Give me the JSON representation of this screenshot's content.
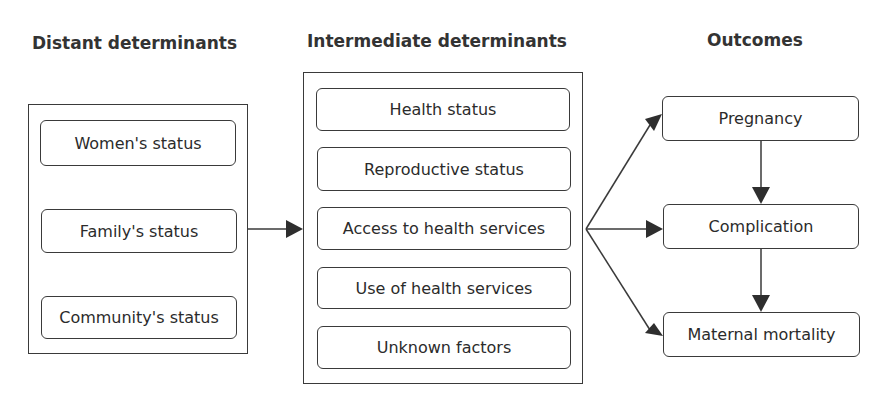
{
  "headers": {
    "distant": "Distant determinants",
    "intermediate": "Intermediate determinants",
    "outcomes": "Outcomes"
  },
  "distant": [
    "Women's status",
    "Family's status",
    "Community's status"
  ],
  "intermediate": [
    "Health status",
    "Reproductive status",
    "Access to health services",
    "Use of health services",
    "Unknown factors"
  ],
  "outcomes": [
    "Pregnancy",
    "Complication",
    "Maternal mortality"
  ],
  "colors": {
    "line": "#3a3a3a",
    "text": "#2b2b2b"
  }
}
